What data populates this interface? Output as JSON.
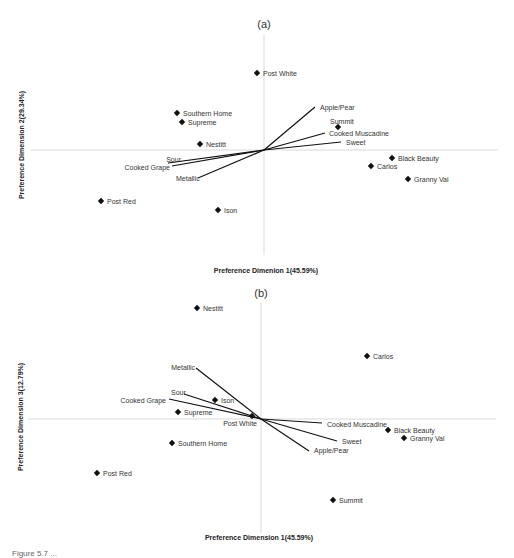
{
  "chart_data": [
    {
      "type": "scatter",
      "title": "(a)",
      "xlabel": "Preference Dimenion 1(45.59%)",
      "ylabel": "Preference Dimension 2(29.34%)",
      "grid": false,
      "legend": null,
      "description": "Biplot of product preference map with attribute vectors from origin",
      "points": [
        {
          "name": "Post White",
          "x": -0.08,
          "y": 0.77
        },
        {
          "name": "Southern Home",
          "x": -0.87,
          "y": 0.37
        },
        {
          "name": "Supreme",
          "x": -0.82,
          "y": 0.28
        },
        {
          "name": "Nestitt",
          "x": -0.64,
          "y": 0.06
        },
        {
          "name": "Summit",
          "x": 0.74,
          "y": 0.23
        },
        {
          "name": "Black Beauty",
          "x": 1.28,
          "y": -0.08
        },
        {
          "name": "Carlos",
          "x": 1.07,
          "y": -0.16
        },
        {
          "name": "Granny Val",
          "x": 1.44,
          "y": -0.29
        },
        {
          "name": "Post Red",
          "x": -1.63,
          "y": -0.51
        },
        {
          "name": "Ison",
          "x": -0.46,
          "y": -0.6
        }
      ],
      "vectors": [
        {
          "name": "Apple/Pear",
          "x": 0.51,
          "y": 0.43
        },
        {
          "name": "Cooked Muscadine",
          "x": 0.61,
          "y": 0.17
        },
        {
          "name": "Sweet",
          "x": 0.77,
          "y": 0.08
        },
        {
          "name": "Sour",
          "x": -0.96,
          "y": -0.13
        },
        {
          "name": "Cooked Grape",
          "x": -0.92,
          "y": -0.16
        },
        {
          "name": "Metallic",
          "x": -0.66,
          "y": -0.28
        }
      ]
    },
    {
      "type": "scatter",
      "title": "(b)",
      "xlabel": "Preference Dimension 1(45.59%)",
      "ylabel": "Preference Dimension 3(12.79%)",
      "grid": false,
      "legend": null,
      "description": "Biplot of product preference map with attribute vectors from origin",
      "points": [
        {
          "name": "Nestitt",
          "x": -0.64,
          "y": 1.11
        },
        {
          "name": "Carlos",
          "x": 1.06,
          "y": 0.63
        },
        {
          "name": "Ison",
          "x": -0.46,
          "y": 0.19
        },
        {
          "name": "Supreme",
          "x": -0.83,
          "y": 0.07
        },
        {
          "name": "Post White",
          "x": -0.09,
          "y": 0.03
        },
        {
          "name": "Black Beauty",
          "x": 1.27,
          "y": -0.11
        },
        {
          "name": "Granny Val",
          "x": 1.43,
          "y": -0.19
        },
        {
          "name": "Southern Home",
          "x": -0.89,
          "y": -0.24
        },
        {
          "name": "Post Red",
          "x": -1.64,
          "y": -0.54
        },
        {
          "name": "Summit",
          "x": 0.72,
          "y": -0.81
        }
      ],
      "vectors": [
        {
          "name": "Metallic",
          "x": -0.65,
          "y": 0.51
        },
        {
          "name": "Sour",
          "x": -0.77,
          "y": 0.25
        },
        {
          "name": "Cooked Grape",
          "x": -0.92,
          "y": 0.2
        },
        {
          "name": "Cooked Muscadine",
          "x": 0.61,
          "y": -0.04
        },
        {
          "name": "Sweet",
          "x": 0.76,
          "y": -0.22
        },
        {
          "name": "Apple/Pear",
          "x": 0.48,
          "y": -0.32
        }
      ]
    }
  ],
  "panels": [
    {
      "title": "(a)",
      "xlabel": "Preference Dimenion 1(45.59%)",
      "ylabel": "Preference Dimension 2(29.34%)",
      "origin": [
        264,
        150
      ],
      "xaxis": [
        31,
        498
      ],
      "yaxis": [
        35,
        255
      ],
      "points": [
        {
          "label": "Post White",
          "px": 257,
          "py": 73,
          "lx": 263,
          "ly": 76,
          "anchor": "start"
        },
        {
          "label": "Southern Home",
          "px": 177,
          "py": 113,
          "lx": 183,
          "ly": 116,
          "anchor": "start"
        },
        {
          "label": "Supreme",
          "px": 182,
          "py": 122,
          "lx": 188,
          "ly": 125,
          "anchor": "start"
        },
        {
          "label": "Nestitt",
          "px": 200,
          "py": 144,
          "lx": 206,
          "ly": 147,
          "anchor": "start"
        },
        {
          "label": "Summit",
          "px": 338,
          "py": 127,
          "lx": 330,
          "ly": 124,
          "anchor": "start"
        },
        {
          "label": "Black Beauty",
          "px": 392,
          "py": 158,
          "lx": 398,
          "ly": 161,
          "anchor": "start"
        },
        {
          "label": "Carlos",
          "px": 371,
          "py": 166,
          "lx": 377,
          "ly": 169,
          "anchor": "start"
        },
        {
          "label": "Granny Val",
          "px": 408,
          "py": 179,
          "lx": 414,
          "ly": 182,
          "anchor": "start"
        },
        {
          "label": "Post Red",
          "px": 101,
          "py": 201,
          "lx": 107,
          "ly": 204,
          "anchor": "start"
        },
        {
          "label": "Ison",
          "px": 218,
          "py": 210,
          "lx": 224,
          "ly": 213,
          "anchor": "start"
        }
      ],
      "vectors": [
        {
          "label": "Apple/Pear",
          "ex": 315,
          "ey": 107,
          "lx": 320,
          "ly": 110,
          "anchor": "start"
        },
        {
          "label": "Cooked Muscadine",
          "ex": 325,
          "ey": 133,
          "lx": 329,
          "ly": 136,
          "anchor": "start"
        },
        {
          "label": "Sweet",
          "ex": 341,
          "ey": 142,
          "lx": 346,
          "ly": 145,
          "anchor": "start"
        },
        {
          "label": "Sour",
          "ex": 168,
          "ey": 163,
          "lx": 181,
          "ly": 162,
          "anchor": "end"
        },
        {
          "label": "Cooked Grape",
          "ex": 172,
          "ey": 166,
          "lx": 170,
          "ly": 170,
          "anchor": "end"
        },
        {
          "label": "Metallic",
          "ex": 198,
          "ey": 178,
          "lx": 176,
          "ly": 181,
          "anchor": "start"
        }
      ]
    },
    {
      "title": "(b)",
      "xlabel": "Preference Dimension 1(45.59%)",
      "ylabel": "Preference Dimension 3(12.79%)",
      "origin": [
        261,
        419
      ],
      "xaxis": [
        28,
        496
      ],
      "yaxis": [
        303,
        533
      ],
      "points": [
        {
          "label": "Nestitt",
          "px": 197,
          "py": 308,
          "lx": 203,
          "ly": 311,
          "anchor": "start"
        },
        {
          "label": "Carlos",
          "px": 367,
          "py": 356,
          "lx": 373,
          "ly": 359,
          "anchor": "start"
        },
        {
          "label": "Ison",
          "px": 215,
          "py": 400,
          "lx": 221,
          "ly": 403,
          "anchor": "start"
        },
        {
          "label": "Supreme",
          "px": 178,
          "py": 412,
          "lx": 184,
          "ly": 415,
          "anchor": "start"
        },
        {
          "label": "Post White",
          "px": 252,
          "py": 416,
          "lx": 257,
          "ly": 426,
          "anchor": "end"
        },
        {
          "label": "Black Beauty",
          "px": 388,
          "py": 430,
          "lx": 394,
          "ly": 433,
          "anchor": "start"
        },
        {
          "label": "Granny Val",
          "px": 404,
          "py": 438,
          "lx": 410,
          "ly": 441,
          "anchor": "start"
        },
        {
          "label": "Southern Home",
          "px": 172,
          "py": 443,
          "lx": 178,
          "ly": 446,
          "anchor": "start"
        },
        {
          "label": "Post Red",
          "px": 97,
          "py": 473,
          "lx": 103,
          "ly": 476,
          "anchor": "start"
        },
        {
          "label": "Summit",
          "px": 333,
          "py": 500,
          "lx": 339,
          "ly": 503,
          "anchor": "start"
        }
      ],
      "vectors": [
        {
          "label": "Metallic",
          "ex": 196,
          "ey": 368,
          "lx": 195,
          "ly": 370,
          "anchor": "end"
        },
        {
          "label": "Sour",
          "ex": 184,
          "ey": 394,
          "lx": 171,
          "ly": 395,
          "anchor": "start"
        },
        {
          "label": "Cooked Grape",
          "ex": 169,
          "ey": 399,
          "lx": 166,
          "ly": 403,
          "anchor": "end"
        },
        {
          "label": "Cooked Muscadine",
          "ex": 322,
          "ey": 423,
          "lx": 327,
          "ly": 427,
          "anchor": "start"
        },
        {
          "label": "Sweet",
          "ex": 337,
          "ey": 441,
          "lx": 342,
          "ly": 444,
          "anchor": "start"
        },
        {
          "label": "Apple/Pear",
          "ex": 309,
          "ey": 451,
          "lx": 314,
          "ly": 453,
          "anchor": "start"
        }
      ]
    }
  ],
  "caption": "Figure 5.7 ..."
}
